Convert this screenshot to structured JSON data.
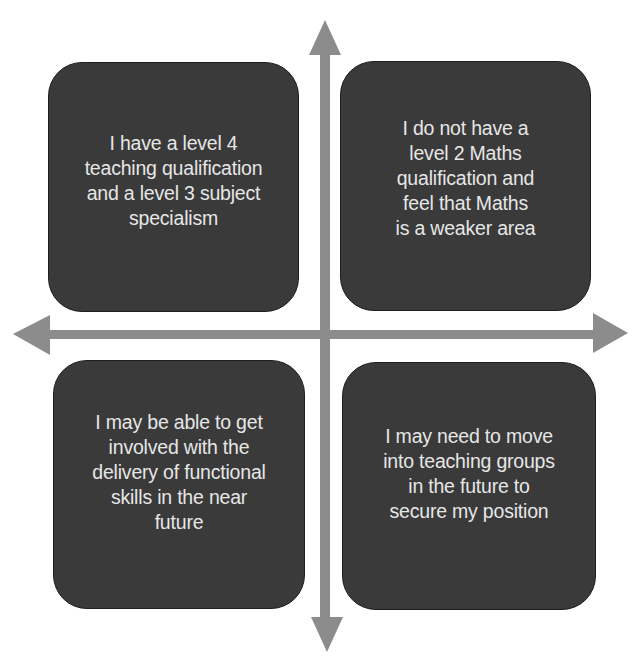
{
  "diagram": {
    "type": "quadrant-diagram",
    "colors": {
      "box_fill": "#3a3a3a",
      "box_border": "#1e1e1e",
      "box_text": "#e6e6e6",
      "arrow": "#8c8c8c",
      "background": "#ffffff"
    },
    "quadrants": [
      {
        "position": "top-left",
        "text": "I have a level 4\nteaching qualification\nand a level 3 subject\nspecialism"
      },
      {
        "position": "top-right",
        "text": "I do not have a\nlevel 2 Maths\nqualification and\nfeel that Maths\nis a weaker area"
      },
      {
        "position": "bottom-left",
        "text": "I may be able to get\ninvolved with the\ndelivery of functional\nskills in the near\nfuture"
      },
      {
        "position": "bottom-right",
        "text": "I may need to move\ninto teaching groups\nin the future to\nsecure my position"
      }
    ],
    "axes": {
      "vertical": {
        "icon": "double-headed-arrow-vertical"
      },
      "horizontal": {
        "icon": "double-headed-arrow-horizontal"
      }
    }
  }
}
